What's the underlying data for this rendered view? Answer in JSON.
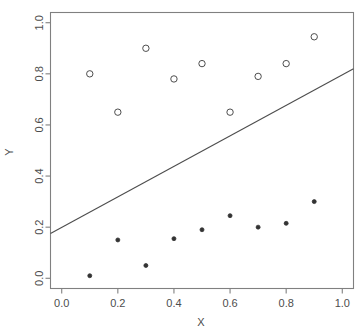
{
  "chart_data": {
    "type": "scatter",
    "title": "",
    "subtitle": "",
    "xlabel": "X",
    "ylabel": "Y",
    "xlim": [
      -0.04,
      1.04
    ],
    "ylim": [
      -0.04,
      1.04
    ],
    "xticks": [
      0.0,
      0.2,
      0.4,
      0.6,
      0.8,
      1.0
    ],
    "yticks": [
      0.0,
      0.2,
      0.4,
      0.6,
      0.8,
      1.0
    ],
    "xticklabels": [
      "0.0",
      "0.2",
      "0.4",
      "0.6",
      "0.8",
      "1.0"
    ],
    "yticklabels": [
      "0.0",
      "0.2",
      "0.4",
      "0.6",
      "0.8",
      "1.0"
    ],
    "grid": false,
    "legend": false,
    "legend_position": "none",
    "series": [
      {
        "name": "upper-group",
        "marker": "open-circle",
        "color": "#4d4d4d",
        "x": [
          0.1,
          0.2,
          0.3,
          0.4,
          0.5,
          0.6,
          0.7,
          0.8,
          0.9
        ],
        "y": [
          0.8,
          0.65,
          0.9,
          0.78,
          0.84,
          0.65,
          0.79,
          0.84,
          0.945
        ]
      },
      {
        "name": "lower-group",
        "marker": "filled-circle",
        "color": "#333333",
        "x": [
          0.1,
          0.2,
          0.3,
          0.4,
          0.5,
          0.6,
          0.7,
          0.8,
          0.9
        ],
        "y": [
          0.01,
          0.15,
          0.05,
          0.155,
          0.19,
          0.245,
          0.2,
          0.215,
          0.3
        ]
      }
    ],
    "lines": [
      {
        "name": "regression-line",
        "color": "#4d4d4d",
        "x": [
          -0.04,
          1.04
        ],
        "y": [
          0.175,
          0.82
        ]
      }
    ],
    "annotations": []
  },
  "axes": {
    "x_title": "X",
    "y_title": "Y"
  },
  "colors": {
    "axis": "#808080",
    "text": "#4d4d4d",
    "marker_open": "#4d4d4d",
    "marker_filled": "#333333",
    "line": "#4d4d4d",
    "background": "#ffffff"
  }
}
